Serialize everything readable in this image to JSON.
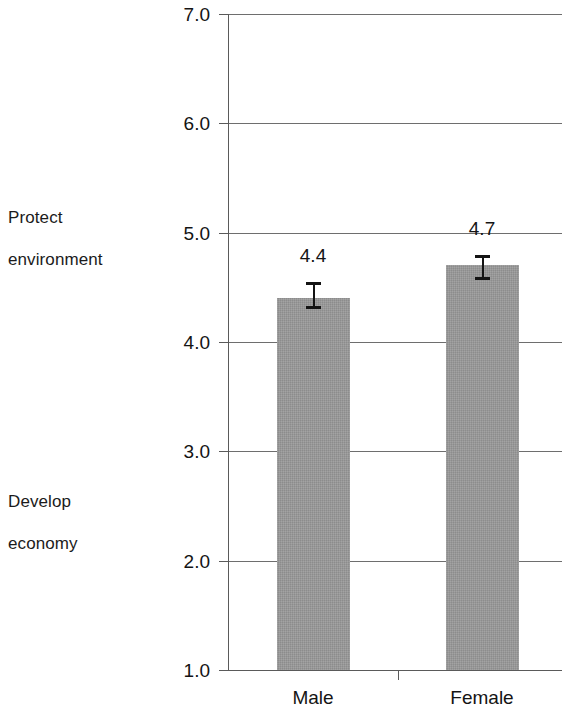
{
  "chart_data": {
    "type": "bar",
    "title": "",
    "subtitle": "",
    "xlabel": "",
    "ylabel": "",
    "categories": [
      "Male",
      "Female"
    ],
    "values": [
      4.4,
      4.7
    ],
    "data_labels": [
      "4.4",
      "4.7"
    ],
    "errors": [
      {
        "category": "Male",
        "lower": 4.3,
        "upper": 4.55
      },
      {
        "category": "Female",
        "lower": 4.57,
        "upper": 4.8
      }
    ],
    "ylim": [
      1.0,
      7.0
    ],
    "ytick_labels": [
      "1.0",
      "2.0",
      "3.0",
      "4.0",
      "5.0",
      "6.0",
      "7.0"
    ],
    "ytick_values": [
      1.0,
      2.0,
      3.0,
      4.0,
      5.0,
      6.0,
      7.0
    ],
    "grid": true,
    "grid_axis": "y",
    "legend": false,
    "legend_position": "none",
    "bar_color": "#9a9a9a",
    "error_bar_color": "#141414",
    "axis_color": "#5a5a5a",
    "scale_anchors": [
      {
        "id": "top",
        "text": "Protect\nenvironment",
        "at_value": 7.0
      },
      {
        "id": "bottom",
        "text": "Develop\neconomy",
        "at_value": 1.0
      }
    ]
  },
  "axis": {
    "y_ticks": [
      {
        "label": "7.0",
        "value": 7.0
      },
      {
        "label": "6.0",
        "value": 6.0
      },
      {
        "label": "5.0",
        "value": 5.0
      },
      {
        "label": "4.0",
        "value": 4.0
      },
      {
        "label": "3.0",
        "value": 3.0
      },
      {
        "label": "2.0",
        "value": 2.0
      },
      {
        "label": "1.0",
        "value": 1.0
      }
    ],
    "x_ticks": [
      {
        "label": "Male"
      },
      {
        "label": "Female"
      }
    ]
  },
  "anchors": {
    "top_line1": "Protect",
    "top_line2": "environment",
    "bottom_line1": "Develop",
    "bottom_line2": "economy"
  },
  "bars": [
    {
      "category": "Male",
      "value": 4.4,
      "label": "4.4"
    },
    {
      "category": "Female",
      "value": 4.7,
      "label": "4.7"
    }
  ]
}
